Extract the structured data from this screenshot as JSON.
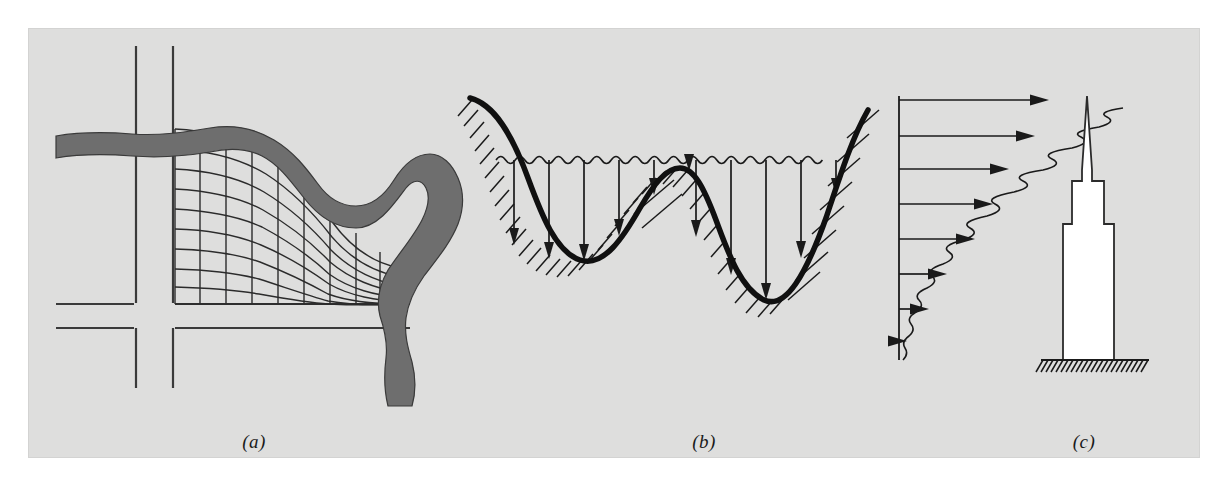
{
  "figure": {
    "background_color": "#dededd",
    "page_color": "#ffffff",
    "ink_color": "#1a1a1a",
    "river_fill_color": "#6e6e6e",
    "building_fill_color": "#ffffff",
    "panel_count": 3
  },
  "labels": {
    "a": "(a)",
    "b": "(b)",
    "c": "(c)"
  },
  "panel_a": {
    "name": "urban-river-grid-plan-view",
    "description": "Plan view of a curvilinear body-fitted computational grid fitted between a city street network and a meandering river channel",
    "river": {
      "name": "river-channel",
      "fill": "#6e6e6e",
      "outline": "#3a3a3a",
      "enters_edge": "left",
      "exits_edge": "bottom"
    },
    "grid": {
      "name": "curvilinear-mesh",
      "columns": 9,
      "rows": 9,
      "line_color": "#2b2b2b",
      "line_width": 1.4
    },
    "streets": {
      "name": "street-network",
      "line_color": "#3a3a3a",
      "vertical_lines": 2,
      "horizontal_lines": 2
    }
  },
  "panel_b": {
    "name": "channel-cross-section-bathymetry",
    "description": "Cross-section of a river channel bed with a wavy free water surface and vertical depth sounding arrows measured down to the bed",
    "water_surface": {
      "name": "wavy-water-surface",
      "style": "wavy",
      "wave_count": 26
    },
    "bed": {
      "name": "channel-bed-profile",
      "line_width": 5,
      "hatch_side": "below",
      "troughs": 2,
      "crests": 1
    },
    "depth_arrows": {
      "name": "depth-sounding-arrows",
      "count": 11,
      "direction": "down"
    }
  },
  "panel_c": {
    "name": "boundary-layer-wind-profile-building",
    "description": "Atmospheric boundary layer wind velocity profile with wavy turbulent envelope beside a stepped skyscraper with spire resting on hatched ground",
    "velocity_profile": {
      "name": "wind-velocity-profile",
      "arrow_count": 8,
      "direction": "right",
      "envelope_style": "wavy",
      "arrow_lengths": [
        148,
        134,
        112,
        96,
        80,
        58,
        40,
        14
      ],
      "profile_shape": "logarithmic"
    },
    "building": {
      "name": "skyscraper-silhouette",
      "fill": "#ffffff",
      "outline": "#2b2b2b",
      "setback_levels": 3,
      "has_spire": true
    },
    "ground": {
      "name": "ground-hatching",
      "hatch_count": 24
    }
  }
}
